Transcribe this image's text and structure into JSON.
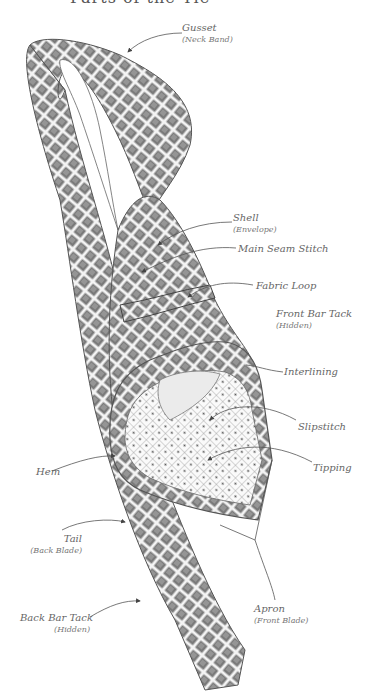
{
  "title": "Parts of the Tie",
  "colors": {
    "ink": "#555555",
    "fabric_dark": "#6e6e6e",
    "fabric_mid": "#9a9a9a",
    "lining": "#d8d8d8",
    "label": "#666666"
  },
  "labels": [
    {
      "id": "gusset",
      "name": "Gusset",
      "sub": "(Neck Band)"
    },
    {
      "id": "shell",
      "name": "Shell",
      "sub": "(Envelope)"
    },
    {
      "id": "main-seam-stitch",
      "name": "Main Seam Stitch",
      "sub": ""
    },
    {
      "id": "fabric-loop",
      "name": "Fabric Loop",
      "sub": ""
    },
    {
      "id": "front-bar-tack",
      "name": "Front Bar Tack",
      "sub": "(Hidden)"
    },
    {
      "id": "interlining",
      "name": "Interlining",
      "sub": ""
    },
    {
      "id": "slipstitch",
      "name": "Slipstitch",
      "sub": ""
    },
    {
      "id": "tipping",
      "name": "Tipping",
      "sub": ""
    },
    {
      "id": "hem",
      "name": "Hem",
      "sub": ""
    },
    {
      "id": "tail",
      "name": "Tail",
      "sub": "(Back Blade)"
    },
    {
      "id": "back-bar-tack",
      "name": "Back Bar Tack",
      "sub": "(Hidden)"
    },
    {
      "id": "apron",
      "name": "Apron",
      "sub": "(Front Blade)"
    }
  ]
}
